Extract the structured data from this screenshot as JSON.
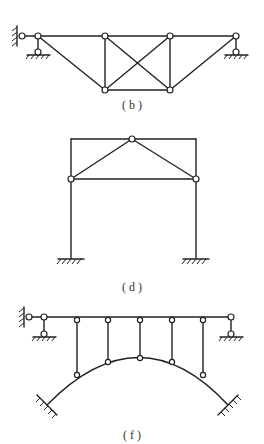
{
  "figures": [
    {
      "id": "b",
      "label": "( b )",
      "description": "Truss with pinned wall support at left and roller supports, X-braced middle panel"
    },
    {
      "id": "d",
      "label": "( d )",
      "description": "Portal frame with fixed bases, hinged triangular tie inside"
    },
    {
      "id": "f",
      "label": "( f )",
      "description": "Deck supported by hinged hangers on a fixed-end arch"
    }
  ],
  "colors": {
    "line": "#222222",
    "background": "#ffffff",
    "label": "#333333"
  }
}
